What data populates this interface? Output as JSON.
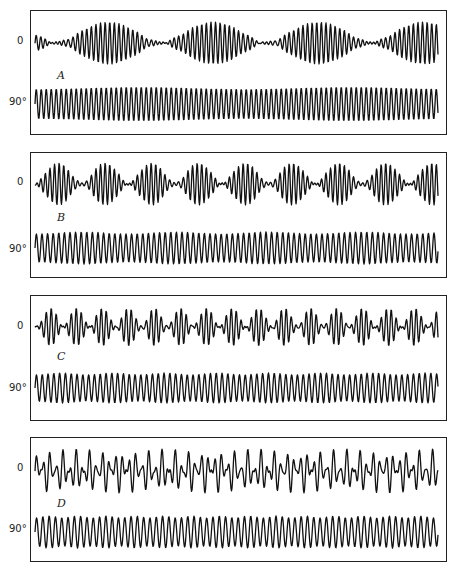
{
  "figure": {
    "panels": [
      {
        "id": "A",
        "letter": "A",
        "top_label": "0",
        "bottom_label": "90°",
        "box": {
          "top": 10,
          "height": 125
        },
        "label_y": {
          "top": 42,
          "letter": 76,
          "bottom": 103
        },
        "traces": {
          "top": {
            "center_y": 32,
            "amp": 21,
            "period": 4.6,
            "envelope": "beat",
            "beat_period": 210,
            "beat_phase": -0.1,
            "baseline_ripple": 1.2
          },
          "bottom": {
            "center_y": 93,
            "amp": 17,
            "period": 5.0,
            "envelope": "slight",
            "beat_period": 210,
            "mod_depth": 0.12
          }
        }
      },
      {
        "id": "B",
        "letter": "B",
        "top_label": "0",
        "bottom_label": "90°",
        "box": {
          "top": 152,
          "height": 126
        },
        "label_y": {
          "top": 183,
          "letter": 218,
          "bottom": 250
        },
        "traces": {
          "top": {
            "center_y": 31,
            "amp": 21,
            "period": 4.6,
            "envelope": "beat",
            "beat_period": 93.5,
            "beat_phase": 0.5,
            "baseline_ripple": 1.2
          },
          "bottom": {
            "center_y": 95,
            "amp": 16,
            "period": 5.6,
            "envelope": "slight",
            "beat_period": 93.5,
            "mod_depth": 0.12
          }
        }
      },
      {
        "id": "C",
        "letter": "C",
        "top_label": "0",
        "bottom_label": "90°",
        "box": {
          "top": 295,
          "height": 126
        },
        "label_y": {
          "top": 327,
          "letter": 357,
          "bottom": 389
        },
        "traces": {
          "top": {
            "center_y": 31,
            "amp": 19,
            "period": 5.0,
            "envelope": "beat",
            "beat_period": 52,
            "beat_phase": 0.45,
            "baseline_ripple": 1.0
          },
          "bottom": {
            "center_y": 92,
            "amp": 15,
            "period": 5.8,
            "envelope": "slight",
            "beat_period": 52,
            "mod_depth": 0.12
          }
        }
      },
      {
        "id": "D",
        "letter": "D",
        "top_label": "0",
        "bottom_label": "90°",
        "box": {
          "top": 437,
          "height": 125
        },
        "label_y": {
          "top": 469,
          "letter": 504,
          "bottom": 530
        },
        "traces": {
          "top": {
            "center_y": 33,
            "amp": 22,
            "period": 6.6,
            "envelope": "beat",
            "beat_period": 28.5,
            "beat_phase": 0.3,
            "baseline_ripple": 1.5
          },
          "bottom": {
            "center_y": 94,
            "amp": 16,
            "period": 6.3,
            "envelope": "slight",
            "beat_period": 28.5,
            "mod_depth": 0.12
          }
        }
      }
    ],
    "colors": {
      "ink": "#111111",
      "frame": "#222222",
      "background": "#ffffff"
    }
  }
}
